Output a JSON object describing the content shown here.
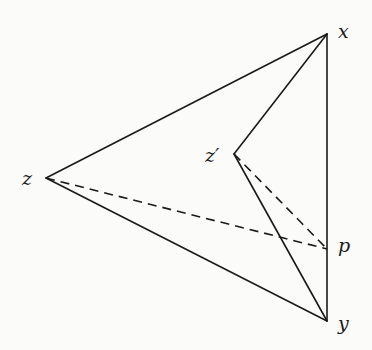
{
  "diagram": {
    "type": "geometric-figure",
    "points": {
      "x": {
        "label": "x",
        "cx": 327,
        "cy": 34,
        "lx": 338,
        "ly": 38
      },
      "y": {
        "label": "y",
        "cx": 327,
        "cy": 321,
        "lx": 338,
        "ly": 330
      },
      "z": {
        "label": "z",
        "cx": 46,
        "cy": 178,
        "lx": 22,
        "ly": 185
      },
      "zp": {
        "label": "z′",
        "cx": 234,
        "cy": 154,
        "lx": 205,
        "ly": 162
      },
      "p": {
        "label": "p",
        "cx": 327,
        "cy": 249,
        "lx": 338,
        "ly": 252
      }
    },
    "solid_edges": [
      [
        "x",
        "z"
      ],
      [
        "z",
        "y"
      ],
      [
        "x",
        "y"
      ],
      [
        "x",
        "zp"
      ],
      [
        "zp",
        "y"
      ]
    ],
    "dashed_edges": [
      [
        "z",
        "p"
      ],
      [
        "zp",
        "p"
      ]
    ],
    "colors": {
      "stroke": "#1a1a1a",
      "background": "#fbfbfa"
    }
  }
}
